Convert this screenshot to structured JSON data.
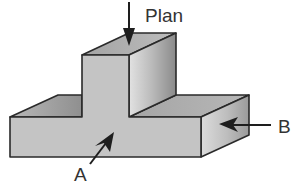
{
  "diagram": {
    "labels": {
      "plan": "Plan",
      "a": "A",
      "b": "B"
    },
    "colors": {
      "outline": "#2a2a2a",
      "face_front": "#c4c4c4",
      "face_top": "#a9a9a9",
      "face_side_light": "#d6d6d6",
      "face_side_dark": "#8e8e8e",
      "arrow": "#1e1e1e",
      "text": "#333333"
    }
  }
}
